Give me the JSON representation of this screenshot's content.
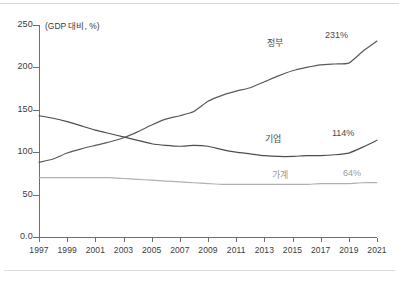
{
  "chart_data": {
    "type": "line",
    "title": "",
    "subtitle": "",
    "unit_label": "(GDP 대비, %)",
    "xlabel": "",
    "ylabel": "",
    "ylim": [
      0,
      250
    ],
    "yticks": [
      "0.0",
      "50",
      "100",
      "150",
      "200",
      "250"
    ],
    "ytick_values": [
      0,
      50,
      100,
      150,
      200,
      250
    ],
    "xlim": [
      1997,
      2021
    ],
    "xticks": [
      "1997",
      "1999",
      "2001",
      "2003",
      "2005",
      "2007",
      "2009",
      "2011",
      "2013",
      "2015",
      "2017",
      "2019",
      "2021"
    ],
    "xtick_values": [
      1997,
      1999,
      2001,
      2003,
      2005,
      2007,
      2009,
      2011,
      2013,
      2015,
      2017,
      2019,
      2021
    ],
    "grid": false,
    "legend": "inline-annotations",
    "x": [
      1997,
      1998,
      1999,
      2000,
      2001,
      2002,
      2003,
      2004,
      2005,
      2006,
      2007,
      2008,
      2009,
      2010,
      2011,
      2012,
      2013,
      2014,
      2015,
      2016,
      2017,
      2018,
      2019,
      2020,
      2021
    ],
    "series": [
      {
        "name": "정부",
        "label": "정부",
        "color": "#5a5a5a",
        "end_label": "231%",
        "end_value": 231,
        "values": [
          88,
          92,
          99,
          104,
          108,
          112,
          117,
          124,
          132,
          139,
          143,
          148,
          160,
          167,
          172,
          176,
          183,
          190,
          196,
          200,
          203,
          204,
          205,
          219,
          231
        ]
      },
      {
        "name": "기업",
        "label": "기업",
        "color": "#4d4d4d",
        "end_label": "114%",
        "end_value": 114,
        "values": [
          143,
          140,
          136,
          131,
          126,
          122,
          118,
          114,
          110,
          108,
          107,
          108,
          107,
          103,
          100,
          98,
          96,
          95,
          95,
          96,
          96,
          97,
          99,
          106,
          114
        ]
      },
      {
        "name": "가계",
        "label": "가계",
        "color": "#b0b0b0",
        "end_label": "64%",
        "end_value": 64,
        "values": [
          70,
          70,
          70,
          70,
          70,
          70,
          69,
          68,
          67,
          66,
          65,
          64,
          63,
          62,
          62,
          62,
          62,
          62,
          62,
          62,
          63,
          63,
          63,
          64,
          64
        ]
      }
    ]
  }
}
